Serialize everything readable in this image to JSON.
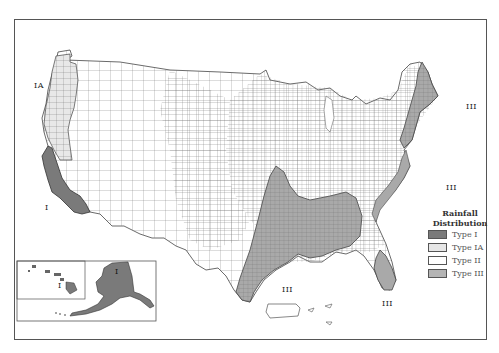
{
  "map": {
    "subject": "US rainfall distribution types by county",
    "region_labels": [
      {
        "id": "ia-northwest",
        "text": "IA"
      },
      {
        "id": "i-california",
        "text": "I"
      },
      {
        "id": "iii-northeast",
        "text": "III"
      },
      {
        "id": "iii-southeast-atlantic",
        "text": "III"
      },
      {
        "id": "iii-gulf",
        "text": "III"
      },
      {
        "id": "iii-florida",
        "text": "III"
      },
      {
        "id": "i-alaska",
        "text": "I"
      },
      {
        "id": "i-hawaii",
        "text": "I"
      }
    ],
    "insets": [
      "Alaska",
      "Hawaii"
    ]
  },
  "legend": {
    "title_line1": "Rainfall",
    "title_line2": "Distribution",
    "items": [
      {
        "label": "Type I",
        "color": "#7a7a7a"
      },
      {
        "label": "Type IA",
        "color": "#e6e6e6"
      },
      {
        "label": "Type II",
        "color": "#ffffff"
      },
      {
        "label": "Type III",
        "color": "#b4b4b4"
      }
    ]
  },
  "colors": {
    "type_i": "#7a7a7a",
    "type_ia": "#e8e8e8",
    "type_ii": "#ffffff",
    "type_iii": "#a9a9a9",
    "county_lines": "#6a6a6a",
    "frame": "#555555"
  }
}
